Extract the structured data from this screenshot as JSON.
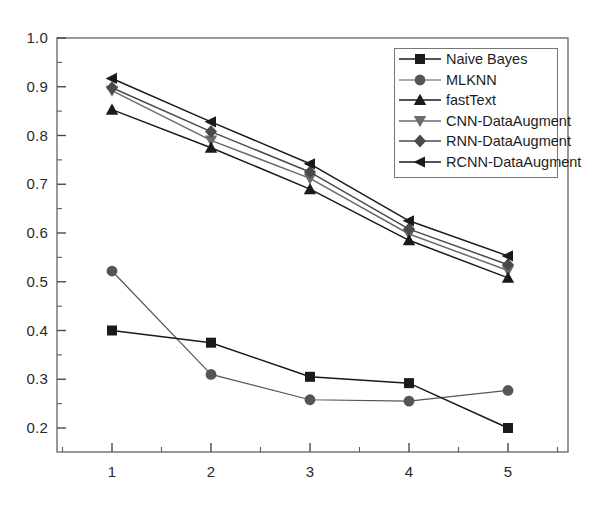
{
  "chart_data": {
    "type": "line",
    "title": "",
    "xlabel": "",
    "ylabel": "",
    "x": [
      1,
      2,
      3,
      4,
      5
    ],
    "categories": [
      "1",
      "2",
      "3",
      "4",
      "5"
    ],
    "xlim": [
      0.55,
      5.5
    ],
    "ylim": [
      0.155,
      1.0
    ],
    "xticks": [
      "1",
      "2",
      "3",
      "4",
      "5"
    ],
    "yticks": [
      "1.0",
      "0.9",
      "0.8",
      "0.7",
      "0.6",
      "0.5",
      "0.4",
      "0.3",
      "0.2"
    ],
    "ytick_values": [
      1.0,
      0.9,
      0.8,
      0.7,
      0.6,
      0.5,
      0.4,
      0.3,
      0.2
    ],
    "minor_ticks": true,
    "grid": false,
    "legend_position": "upper right",
    "series": [
      {
        "name": "Naive Bayes",
        "marker": "square",
        "color": "#1a1a1a",
        "values": [
          0.4,
          0.375,
          0.305,
          0.292,
          0.2
        ]
      },
      {
        "name": "MLKNN",
        "marker": "circle",
        "color": "#555555",
        "values": [
          0.522,
          0.31,
          0.258,
          0.255,
          0.277
        ]
      },
      {
        "name": "fastText",
        "marker": "triangle-up",
        "color": "#1a1a1a",
        "values": [
          0.853,
          0.775,
          0.69,
          0.585,
          0.508
        ]
      },
      {
        "name": "CNN-DataAugment",
        "marker": "triangle-down",
        "color": "#6b6b6b",
        "values": [
          0.892,
          0.79,
          0.712,
          0.598,
          0.523
        ]
      },
      {
        "name": "RNN-DataAugment",
        "marker": "diamond",
        "color": "#4a4a4a",
        "values": [
          0.898,
          0.808,
          0.725,
          0.608,
          0.535
        ]
      },
      {
        "name": "RCNN-DataAugment",
        "marker": "triangle-left",
        "color": "#1a1a1a",
        "values": [
          0.917,
          0.828,
          0.742,
          0.625,
          0.553
        ]
      }
    ]
  },
  "legend": {
    "items": [
      {
        "label": "Naive Bayes"
      },
      {
        "label": "MLKNN"
      },
      {
        "label": "fastText"
      },
      {
        "label": "CNN-DataAugment"
      },
      {
        "label": "RNN-DataAugment"
      },
      {
        "label": "RCNN-DataAugment"
      }
    ]
  },
  "axes": {
    "y_labels": [
      "1.0",
      "0.9",
      "0.8",
      "0.7",
      "0.6",
      "0.5",
      "0.4",
      "0.3",
      "0.2"
    ],
    "x_labels": [
      "1",
      "2",
      "3",
      "4",
      "5"
    ]
  }
}
